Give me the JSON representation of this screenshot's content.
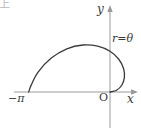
{
  "figure": {
    "kind": "polar-curve-plot",
    "background_color": "#ffffff",
    "ink_color": "#3a3a3a",
    "axis_color": "#9a9a9a"
  },
  "labels": {
    "y_axis": "y",
    "x_axis": "x",
    "origin": "O",
    "x_left_tick": "−π",
    "curve_equation": "r=θ"
  },
  "corner": {
    "clipped_glyph": "上"
  },
  "chart_data": {
    "type": "line",
    "title": "",
    "subtitle": "",
    "xlabel": "x",
    "ylabel": "y",
    "annotations": [
      "r=θ",
      "O",
      "−π"
    ],
    "legend": [],
    "grid": false,
    "equation": "r = θ",
    "parameter": "θ",
    "theta_range": [
      0,
      3.14159
    ],
    "xlim": [
      -3.6,
      1.0
    ],
    "ylim": [
      -0.35,
      2.6
    ],
    "x_axis_intercepts": [
      -3.14159,
      0
    ],
    "y_axis_intercepts": [
      0,
      1.5708
    ],
    "points_polar": [
      {
        "theta": 0.0,
        "r": 0.0,
        "x": 0.0,
        "y": 0.0
      },
      {
        "theta": 0.2618,
        "r": 0.2618,
        "x": 0.2529,
        "y": 0.0677
      },
      {
        "theta": 0.5236,
        "r": 0.5236,
        "x": 0.4534,
        "y": 0.2618
      },
      {
        "theta": 0.7854,
        "r": 0.7854,
        "x": 0.5554,
        "y": 0.5554
      },
      {
        "theta": 1.0472,
        "r": 1.0472,
        "x": 0.5236,
        "y": 0.9069
      },
      {
        "theta": 1.309,
        "r": 1.309,
        "x": 0.3388,
        "y": 1.2644
      },
      {
        "theta": 1.5708,
        "r": 1.5708,
        "x": 0.0,
        "y": 1.5708
      },
      {
        "theta": 1.8326,
        "r": 1.8326,
        "x": -0.4743,
        "y": 1.7701
      },
      {
        "theta": 2.0944,
        "r": 2.0944,
        "x": -1.0472,
        "y": 1.8138
      },
      {
        "theta": 2.3562,
        "r": 2.3562,
        "x": -1.6661,
        "y": 1.6661
      },
      {
        "theta": 2.618,
        "r": 2.618,
        "x": -2.2673,
        "y": 1.309
      },
      {
        "theta": 2.8798,
        "r": 2.8798,
        "x": -2.7765,
        "y": 0.7667
      },
      {
        "theta": 3.0543,
        "r": 3.0543,
        "x": -3.0425,
        "y": 0.2654
      },
      {
        "theta": 3.14159,
        "r": 3.14159,
        "x": -3.14159,
        "y": 0.0
      }
    ]
  }
}
